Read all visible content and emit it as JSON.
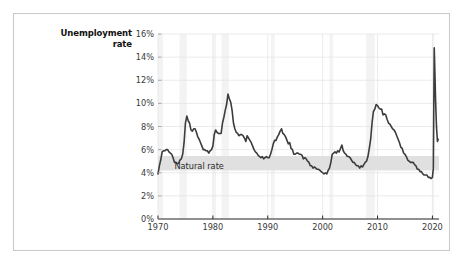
{
  "figure": {
    "background_color": "#ffffff",
    "frame_color": "#c9c9c9",
    "page_background": "#ffffff"
  },
  "chart_data": {
    "type": "line",
    "title": "",
    "subtitle": "",
    "xlabel": "",
    "ylabel": "Unemployment rate",
    "ylabel_line1": "Unemployment",
    "ylabel_line2": "rate",
    "xlim": [
      1970,
      2021.2
    ],
    "ylim": [
      0,
      16
    ],
    "grid": true,
    "grid_color": "#e3e3e3",
    "legend_position": "none",
    "line_color": "#3c3c3c",
    "line_width": 1.6,
    "ytick_labels": [
      "0%",
      "2%",
      "4%",
      "6%",
      "8%",
      "10%",
      "12%",
      "14%",
      "16%"
    ],
    "ytick_values": [
      0,
      2,
      4,
      6,
      8,
      10,
      12,
      14,
      16
    ],
    "xtick_labels": [
      "1970",
      "1980",
      "1990",
      "2000",
      "2010",
      "2020"
    ],
    "xtick_values": [
      1970,
      1980,
      1990,
      2000,
      2010,
      2020
    ],
    "annotations": [
      {
        "name": "natural-rate-band",
        "label": "Natural rate",
        "type": "hband",
        "y_low": 4.2,
        "y_high": 5.45,
        "color": "#e0e0e0",
        "label_x": 1973.0,
        "label_y": 4.55
      }
    ],
    "recession_bands": {
      "color": "#f3f3f3",
      "spans": [
        [
          1969.92,
          1970.92
        ],
        [
          1973.92,
          1975.25
        ],
        [
          1980.08,
          1980.58
        ],
        [
          1981.58,
          1982.92
        ],
        [
          1990.58,
          1991.25
        ],
        [
          2001.25,
          2001.92
        ],
        [
          2007.92,
          2009.5
        ],
        [
          2020.08,
          2020.33
        ]
      ]
    },
    "series": [
      {
        "name": "Unemployment rate",
        "x": [
          1970.0,
          1970.25,
          1970.5,
          1970.75,
          1971.0,
          1971.25,
          1971.5,
          1971.75,
          1972.0,
          1972.25,
          1972.5,
          1972.75,
          1973.0,
          1973.25,
          1973.5,
          1973.75,
          1974.0,
          1974.25,
          1974.5,
          1974.75,
          1975.0,
          1975.25,
          1975.5,
          1975.75,
          1976.0,
          1976.25,
          1976.5,
          1976.75,
          1977.0,
          1977.25,
          1977.5,
          1977.75,
          1978.0,
          1978.25,
          1978.5,
          1978.75,
          1979.0,
          1979.25,
          1979.5,
          1979.75,
          1980.0,
          1980.25,
          1980.5,
          1980.75,
          1981.0,
          1981.25,
          1981.5,
          1981.75,
          1982.0,
          1982.25,
          1982.5,
          1982.75,
          1983.0,
          1983.25,
          1983.5,
          1983.75,
          1984.0,
          1984.25,
          1984.5,
          1984.75,
          1985.0,
          1985.25,
          1985.5,
          1985.75,
          1986.0,
          1986.25,
          1986.5,
          1986.75,
          1987.0,
          1987.25,
          1987.5,
          1987.75,
          1988.0,
          1988.25,
          1988.5,
          1988.75,
          1989.0,
          1989.25,
          1989.5,
          1989.75,
          1990.0,
          1990.25,
          1990.5,
          1990.75,
          1991.0,
          1991.25,
          1991.5,
          1991.75,
          1992.0,
          1992.25,
          1992.5,
          1992.75,
          1993.0,
          1993.25,
          1993.5,
          1993.75,
          1994.0,
          1994.25,
          1994.5,
          1994.75,
          1995.0,
          1995.25,
          1995.5,
          1995.75,
          1996.0,
          1996.25,
          1996.5,
          1996.75,
          1997.0,
          1997.25,
          1997.5,
          1997.75,
          1998.0,
          1998.25,
          1998.5,
          1998.75,
          1999.0,
          1999.25,
          1999.5,
          1999.75,
          2000.0,
          2000.25,
          2000.5,
          2000.75,
          2001.0,
          2001.25,
          2001.5,
          2001.75,
          2002.0,
          2002.25,
          2002.5,
          2002.75,
          2003.0,
          2003.25,
          2003.5,
          2003.75,
          2004.0,
          2004.25,
          2004.5,
          2004.75,
          2005.0,
          2005.25,
          2005.5,
          2005.75,
          2006.0,
          2006.25,
          2006.5,
          2006.75,
          2007.0,
          2007.25,
          2007.5,
          2007.75,
          2008.0,
          2008.25,
          2008.5,
          2008.75,
          2009.0,
          2009.25,
          2009.5,
          2009.75,
          2010.0,
          2010.25,
          2010.5,
          2010.75,
          2011.0,
          2011.25,
          2011.5,
          2011.75,
          2012.0,
          2012.25,
          2012.5,
          2012.75,
          2013.0,
          2013.25,
          2013.5,
          2013.75,
          2014.0,
          2014.25,
          2014.5,
          2014.75,
          2015.0,
          2015.25,
          2015.5,
          2015.75,
          2016.0,
          2016.25,
          2016.5,
          2016.75,
          2017.0,
          2017.25,
          2017.5,
          2017.75,
          2018.0,
          2018.25,
          2018.5,
          2018.75,
          2019.0,
          2019.25,
          2019.5,
          2019.75,
          2020.0,
          2020.17,
          2020.33,
          2020.42,
          2020.58,
          2020.75,
          2020.92,
          2021.05
        ],
        "values": [
          3.9,
          4.6,
          5.1,
          5.8,
          5.9,
          5.9,
          6.0,
          6.0,
          5.8,
          5.7,
          5.6,
          5.3,
          4.9,
          4.9,
          4.8,
          4.8,
          5.1,
          5.2,
          5.6,
          6.6,
          8.3,
          8.9,
          8.5,
          8.3,
          7.7,
          7.6,
          7.8,
          7.8,
          7.5,
          7.1,
          6.9,
          6.6,
          6.3,
          6.0,
          6.0,
          5.9,
          5.9,
          5.7,
          5.9,
          6.0,
          6.3,
          7.3,
          7.7,
          7.5,
          7.4,
          7.4,
          7.4,
          8.3,
          8.8,
          9.4,
          9.9,
          10.8,
          10.4,
          10.1,
          9.4,
          8.3,
          7.8,
          7.5,
          7.4,
          7.2,
          7.3,
          7.3,
          7.2,
          7.0,
          6.7,
          7.2,
          7.0,
          6.8,
          6.6,
          6.3,
          6.0,
          5.8,
          5.7,
          5.5,
          5.4,
          5.3,
          5.4,
          5.2,
          5.3,
          5.4,
          5.3,
          5.3,
          5.6,
          6.0,
          6.5,
          6.8,
          6.8,
          7.1,
          7.3,
          7.6,
          7.8,
          7.4,
          7.3,
          7.1,
          6.8,
          6.5,
          6.6,
          6.1,
          6.0,
          5.6,
          5.6,
          5.7,
          5.7,
          5.6,
          5.6,
          5.5,
          5.2,
          5.3,
          5.2,
          5.0,
          4.9,
          4.6,
          4.6,
          4.4,
          4.5,
          4.4,
          4.3,
          4.3,
          4.2,
          4.1,
          4.0,
          3.9,
          4.0,
          3.9,
          4.2,
          4.4,
          4.9,
          5.6,
          5.7,
          5.8,
          5.7,
          5.9,
          5.8,
          6.1,
          6.4,
          5.9,
          5.7,
          5.6,
          5.4,
          5.4,
          5.3,
          5.1,
          4.9,
          4.9,
          4.7,
          4.6,
          4.6,
          4.4,
          4.6,
          4.5,
          4.7,
          4.9,
          5.0,
          5.4,
          6.1,
          6.9,
          8.3,
          9.3,
          9.5,
          9.9,
          9.8,
          9.6,
          9.5,
          9.5,
          9.0,
          9.1,
          9.0,
          8.6,
          8.3,
          8.2,
          8.0,
          7.8,
          7.7,
          7.5,
          7.2,
          6.9,
          6.6,
          6.2,
          6.1,
          5.7,
          5.6,
          5.4,
          5.1,
          5.0,
          4.9,
          4.9,
          4.9,
          4.7,
          4.6,
          4.3,
          4.3,
          4.1,
          4.1,
          3.9,
          3.8,
          3.8,
          3.8,
          3.6,
          3.6,
          3.5,
          3.6,
          4.4,
          14.8,
          13.3,
          10.2,
          7.9,
          6.7,
          6.9
        ]
      }
    ]
  }
}
